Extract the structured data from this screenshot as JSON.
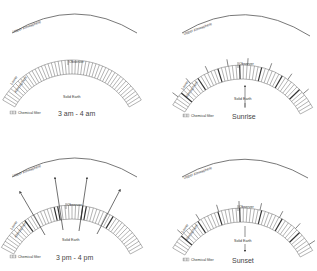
{
  "panels": [
    {
      "id": "panel-3am",
      "upper_label": "Upper Atmosphere",
      "lower_label_1": "Lower",
      "lower_label_2": "Atmosphere",
      "observer_label": "Observer",
      "earth_label": "Solid Earth",
      "legend_label": "Chemical filter",
      "time_label": "3 am - 4 am",
      "earth_arrow": "none",
      "rays": "none"
    },
    {
      "id": "panel-sunrise",
      "upper_label": "Upper Atmosphere",
      "lower_label_1": "Lower",
      "lower_label_2": "Atmosphere",
      "observer_label": "Observer",
      "earth_label": "Solid Earth",
      "legend_label": "Chemical filter",
      "time_label": "Sunrise",
      "earth_arrow": "up",
      "rays": "short"
    },
    {
      "id": "panel-3pm",
      "upper_label": "Upper Atmosphere",
      "lower_label_1": "Lower",
      "lower_label_2": "Atmosphere",
      "observer_label": "Observer",
      "earth_label": "Solid Earth",
      "legend_label": "Chemical filter",
      "time_label": "3 pm - 4 pm",
      "earth_arrow": "none",
      "rays": "long-arrows"
    },
    {
      "id": "panel-sunset",
      "upper_label": "Upper Atmosphere",
      "lower_label_1": "Lower",
      "lower_label_2": "Atmosphere",
      "observer_label": "Observer",
      "earth_label": "Solid Earth",
      "legend_label": "Chemical filter",
      "time_label": "Sunset",
      "earth_arrow": "down",
      "rays": "short"
    }
  ],
  "colors": {
    "line": "#555555",
    "hatch": "#666666",
    "text": "#333333"
  }
}
